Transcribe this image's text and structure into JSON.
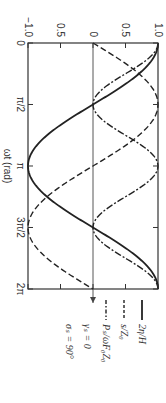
{
  "chart_data": {
    "type": "line",
    "title": "",
    "xlabel": "ωt (rad)",
    "ylabel": "",
    "xlim": [
      0,
      6.2832
    ],
    "ylim": [
      -1.0,
      1.0
    ],
    "x_ticks": [
      "0",
      "π/2",
      "π",
      "3π/2",
      "2π"
    ],
    "y_ticks": [
      "−1.0",
      "0.5",
      "0",
      "0.5",
      "1.0"
    ],
    "grid": false,
    "zero_line": true,
    "legend_position": "right",
    "x": [
      0,
      0.7854,
      1.5708,
      2.3562,
      3.1416,
      3.927,
      4.7124,
      5.4978,
      6.2832
    ],
    "series": [
      {
        "name": "2η/H",
        "style": "solid",
        "values": [
          1.0,
          0.707,
          0.0,
          -0.707,
          -1.0,
          -0.707,
          0.0,
          0.707,
          1.0
        ]
      },
      {
        "name": "s/Z₀",
        "style": "dashed",
        "values": [
          0.0,
          0.707,
          1.0,
          0.707,
          0.0,
          -0.707,
          -1.0,
          -0.707,
          0.0
        ]
      },
      {
        "name": "Pₛ/ωF₀Z₀",
        "style": "dash-dot",
        "values": [
          1.0,
          0.5,
          0.0,
          0.5,
          1.0,
          0.5,
          0.0,
          0.5,
          1.0
        ]
      }
    ],
    "annotations": [
      "γₛ = 0",
      "σₛ = 90°"
    ],
    "rotation": "figure rotated 90° clockwise"
  },
  "labels": {
    "xlabel": "ωt (rad)",
    "xticks": [
      "0",
      "π/2",
      "π",
      "3π/2",
      "2π"
    ],
    "yticks": [
      "−1.0",
      "0.5",
      "0",
      "0.5",
      "1.0"
    ],
    "legend": [
      "2η/H",
      "s/Z₀",
      "Pₛ/ωF₀Z₀"
    ],
    "params": [
      "γₛ = 0",
      "σₛ = 90°"
    ]
  }
}
